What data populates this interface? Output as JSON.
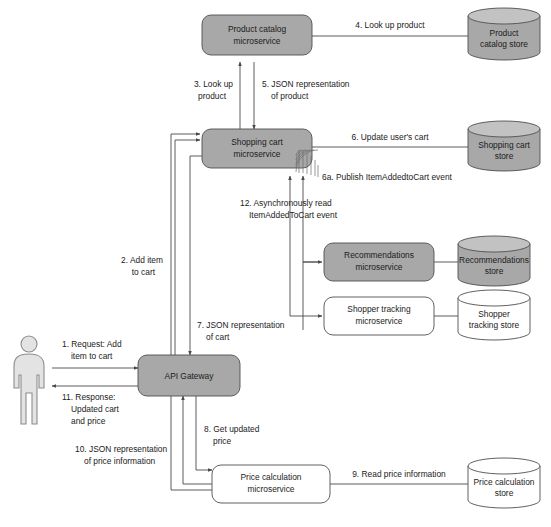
{
  "diagram": {
    "accent_shaded": "#a8a8a8",
    "accent_plain": "#ffffff",
    "line_color": "#4a4a4a",
    "actor": {
      "name": "shopper-actor",
      "label": ""
    },
    "nodes": {
      "product_catalog_service": {
        "line1": "Product catalog",
        "line2": "microservice",
        "shaded": true
      },
      "product_catalog_store": {
        "line1": "Product",
        "line2": "catalog store",
        "shaded": true
      },
      "shopping_cart_service": {
        "line1": "Shopping cart",
        "line2": "microservice",
        "shaded": true
      },
      "shopping_cart_store": {
        "line1": "Shopping cart",
        "line2": "store",
        "shaded": true
      },
      "recommendations_service": {
        "line1": "Recommendations",
        "line2": "microservice",
        "shaded": true
      },
      "recommendations_store": {
        "line1": "Recommendations",
        "line2": "store",
        "shaded": true
      },
      "shopper_tracking_service": {
        "line1": "Shopper tracking",
        "line2": "microservice",
        "shaded": false
      },
      "shopper_tracking_store": {
        "line1": "Shopper",
        "line2": "tracking store",
        "shaded": false
      },
      "api_gateway": {
        "line1": "API Gateway",
        "line2": "",
        "shaded": true
      },
      "price_calculation_service": {
        "line1": "Price calculation",
        "line2": "microservice",
        "shaded": false
      },
      "price_calculation_store": {
        "line1": "Price calculation",
        "line2": "store",
        "shaded": false
      }
    },
    "edges": {
      "e1": {
        "line1": "1. Request: Add",
        "line2": "item to cart"
      },
      "e2": {
        "line1": "2. Add item",
        "line2": "to cart"
      },
      "e3": {
        "line1": "3. Look up",
        "line2": "product"
      },
      "e4": {
        "line1": "4. Look up product",
        "line2": ""
      },
      "e5": {
        "line1": "5. JSON representation",
        "line2": "of product"
      },
      "e6": {
        "line1": "6. Update user's cart",
        "line2": ""
      },
      "e6a": {
        "line1": "6a. Publish ItemAddedtoCart event",
        "line2": ""
      },
      "e7": {
        "line1": "7. JSON representation",
        "line2": "of cart"
      },
      "e8": {
        "line1": "8. Get updated",
        "line2": "price"
      },
      "e9": {
        "line1": "9. Read price information",
        "line2": ""
      },
      "e10": {
        "line1": "10. JSON representation",
        "line2": "of price information"
      },
      "e11": {
        "line1": "11. Response:",
        "line2": "Updated cart",
        "line3": "and price"
      },
      "e12": {
        "line1": "12. Asynchronously read",
        "line2": "ItemAddedToCart event"
      }
    }
  }
}
